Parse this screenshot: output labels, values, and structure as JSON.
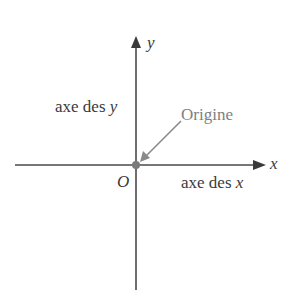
{
  "diagram": {
    "x_axis": {
      "label": "x",
      "name": "axe des x"
    },
    "y_axis": {
      "label": "y",
      "name": "axe des ",
      "name_var": "y"
    },
    "origin": {
      "symbol": "O",
      "callout": "Origine"
    },
    "colors": {
      "axis": "#3a3a3a",
      "callout": "#808080",
      "origin_dot": "#7a7a7a"
    }
  }
}
